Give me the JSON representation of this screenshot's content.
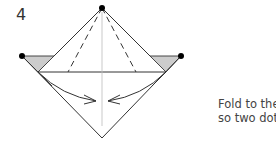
{
  "step": {
    "number": "4"
  },
  "caption": {
    "lines": [
      "Fold to the center",
      "so two dots meet."
    ]
  },
  "colors": {
    "line": "#333333",
    "shade": "#cccccc",
    "guide": "#bbbbbb",
    "dot": "#000000",
    "text": "#444444"
  },
  "diagram": {
    "points": {
      "top_dot": [
        102,
        8
      ],
      "left_dot": [
        22,
        56
      ],
      "right_dot": [
        181,
        56
      ],
      "bottom": [
        102,
        138
      ],
      "left_fold_corner": [
        38,
        72
      ],
      "right_fold_corner": [
        166,
        72
      ]
    },
    "icons": [
      "dot-marker-icon",
      "fold-arrow-icon",
      "valley-fold-line-icon",
      "shaded-flap-icon"
    ]
  }
}
